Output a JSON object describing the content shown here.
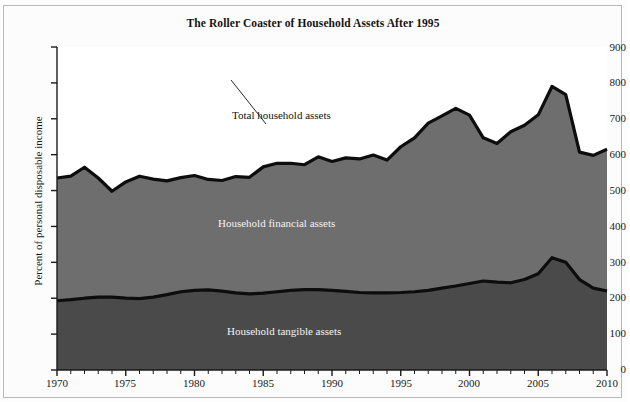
{
  "figure": {
    "title": "The Roller Coaster of Household Assets After 1995",
    "ylabel": "Percent of personal disposable income",
    "background_color": "#ffffff",
    "frame_color": "#b9b9b9"
  },
  "annotations": {
    "total": "Total household assets",
    "financial": "Household financial assets",
    "tangible": "Household tangible assets"
  },
  "colors": {
    "tangible_fill": "#4a4a4a",
    "financial_fill": "#6e6e6e",
    "line": "#0d0d0d",
    "axis": "#1a1a1a",
    "plot_bg": "#ffffff",
    "label_light": "#f3f3f3",
    "label_dark": "#121212"
  },
  "chart_data": {
    "type": "area",
    "title": "The Roller Coaster of Household Assets After 1995",
    "xlabel": "",
    "ylabel": "Percent of personal disposable income",
    "xlim": [
      1970,
      2010
    ],
    "ylim": [
      0,
      900
    ],
    "yticks": [
      0,
      100,
      200,
      300,
      400,
      500,
      600,
      700,
      800,
      900
    ],
    "xticks": [
      1970,
      1975,
      1980,
      1985,
      1990,
      1995,
      2000,
      2005,
      2010
    ],
    "minor_xtick_interval": 1,
    "grid": false,
    "legend": "inline-annotations",
    "stacked": true,
    "x": [
      1970,
      1971,
      1972,
      1973,
      1974,
      1975,
      1976,
      1977,
      1978,
      1979,
      1980,
      1981,
      1982,
      1983,
      1984,
      1985,
      1986,
      1987,
      1988,
      1989,
      1990,
      1991,
      1992,
      1993,
      1994,
      1995,
      1996,
      1997,
      1998,
      1999,
      2000,
      2001,
      2002,
      2003,
      2004,
      2005,
      2006,
      2007,
      2008,
      2009,
      2010
    ],
    "series": [
      {
        "name": "Household tangible assets",
        "values": [
          193,
          196,
          200,
          203,
          203,
          200,
          199,
          203,
          210,
          218,
          222,
          223,
          220,
          215,
          212,
          214,
          218,
          222,
          224,
          224,
          222,
          219,
          216,
          215,
          215,
          216,
          218,
          222,
          228,
          234,
          241,
          248,
          245,
          243,
          252,
          268,
          313,
          300,
          252,
          228,
          220
        ]
      },
      {
        "name": "Household financial assets",
        "values": [
          342,
          344,
          365,
          332,
          295,
          324,
          341,
          329,
          317,
          318,
          320,
          308,
          308,
          324,
          325,
          352,
          358,
          354,
          348,
          370,
          359,
          372,
          372,
          384,
          370,
          406,
          429,
          466,
          480,
          495,
          469,
          399,
          386,
          421,
          430,
          443,
          477,
          467,
          355,
          370,
          395
        ]
      }
    ],
    "total": {
      "name": "Total household assets",
      "values": [
        535,
        540,
        565,
        535,
        498,
        524,
        540,
        532,
        527,
        536,
        542,
        531,
        528,
        539,
        537,
        566,
        576,
        576,
        572,
        594,
        581,
        591,
        588,
        599,
        585,
        622,
        647,
        688,
        708,
        729,
        710,
        647,
        631,
        664,
        682,
        711,
        790,
        767,
        607,
        598,
        615
      ]
    }
  }
}
